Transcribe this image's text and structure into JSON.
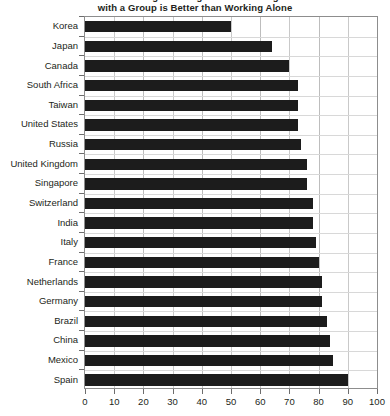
{
  "chart_data": {
    "type": "bar",
    "orientation": "horizontal",
    "title": "Percentage Who Agree that Working\nwith a Group is Better than Working Alone",
    "title_visible_line": "with a Group is Better than Working Alone",
    "xlabel": "",
    "ylabel": "",
    "xlim": [
      0,
      100
    ],
    "xticks": [
      0,
      10,
      20,
      30,
      40,
      50,
      60,
      70,
      80,
      90,
      100
    ],
    "xtick_labels": [
      "0",
      "10",
      "20",
      "30",
      "40",
      "50",
      "60",
      "70",
      "80",
      "90",
      "100"
    ],
    "grid": true,
    "grid_axis": "x",
    "legend": false,
    "bar_color": "#1c1c1c",
    "gridline_color": "#c9c9c9",
    "axis_color": "#8d8d8d",
    "categories": [
      "Korea",
      "Japan",
      "Canada",
      "South Africa",
      "Taiwan",
      "United States",
      "Russia",
      "United Kingdom",
      "Singapore",
      "Switzerland",
      "India",
      "Italy",
      "France",
      "Netherlands",
      "Germany",
      "Brazil",
      "China",
      "Mexico",
      "Spain"
    ],
    "values": [
      50,
      64,
      70,
      73,
      73,
      73,
      74,
      76,
      76,
      78,
      78,
      79,
      80,
      81,
      81,
      83,
      84,
      85,
      90
    ],
    "points": [
      {
        "label": "Korea",
        "value": 50
      },
      {
        "label": "Japan",
        "value": 64
      },
      {
        "label": "Canada",
        "value": 70
      },
      {
        "label": "South Africa",
        "value": 73
      },
      {
        "label": "Taiwan",
        "value": 73
      },
      {
        "label": "United States",
        "value": 73
      },
      {
        "label": "Russia",
        "value": 74
      },
      {
        "label": "United Kingdom",
        "value": 76
      },
      {
        "label": "Singapore",
        "value": 76
      },
      {
        "label": "Switzerland",
        "value": 78
      },
      {
        "label": "India",
        "value": 78
      },
      {
        "label": "Italy",
        "value": 79
      },
      {
        "label": "France",
        "value": 80
      },
      {
        "label": "Netherlands",
        "value": 81
      },
      {
        "label": "Germany",
        "value": 81
      },
      {
        "label": "Brazil",
        "value": 83
      },
      {
        "label": "China",
        "value": 84
      },
      {
        "label": "Mexico",
        "value": 85
      },
      {
        "label": "Spain",
        "value": 90
      }
    ]
  }
}
